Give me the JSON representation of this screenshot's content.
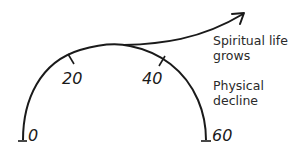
{
  "diagram": {
    "arc_ticks": [
      {
        "label": "0"
      },
      {
        "label": "20"
      },
      {
        "label": "40"
      },
      {
        "label": "60"
      }
    ],
    "spiritual_label": [
      "Spiritual life",
      "grows"
    ],
    "physical_label": [
      "Physical",
      "decline"
    ],
    "stroke_color": "#1a1a1a"
  }
}
